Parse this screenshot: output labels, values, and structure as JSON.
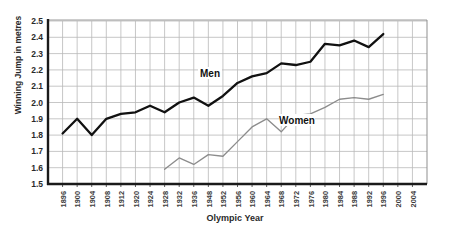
{
  "chart_data": {
    "type": "line",
    "title": "",
    "xlabel": "Olympic Year",
    "ylabel": "Winning Jump in metres",
    "ylim": [
      1.5,
      2.5
    ],
    "ytick_step": 0.1,
    "grid": true,
    "legend_position": "inline-annotation",
    "categories": [
      "1896",
      "1900",
      "1904",
      "1908",
      "1912",
      "1920",
      "1924",
      "1928",
      "1932",
      "1936",
      "1948",
      "1952",
      "1956",
      "1960",
      "1964",
      "1968",
      "1972",
      "1976",
      "1980",
      "1984",
      "1988",
      "1992",
      "1996",
      "2000",
      "2004"
    ],
    "ytick_labels": [
      "1.5",
      "1.6",
      "1.7",
      "1.8",
      "1.9",
      "2.0",
      "2.1",
      "2.2",
      "2.3",
      "2.4",
      "2.5"
    ],
    "series": [
      {
        "name": "Men",
        "color": "#111111",
        "label_annotation": "Men",
        "x": [
          "1896",
          "1900",
          "1904",
          "1908",
          "1912",
          "1920",
          "1924",
          "1928",
          "1932",
          "1936",
          "1948",
          "1952",
          "1956",
          "1960",
          "1964",
          "1968",
          "1972",
          "1976",
          "1980",
          "1984",
          "1988",
          "1992",
          "1996"
        ],
        "values": [
          1.81,
          1.9,
          1.8,
          1.9,
          1.93,
          1.94,
          1.98,
          1.94,
          2.0,
          2.03,
          1.98,
          2.04,
          2.12,
          2.16,
          2.18,
          2.24,
          2.23,
          2.25,
          2.36,
          2.35,
          2.38,
          2.34,
          2.42
        ]
      },
      {
        "name": "Women",
        "color": "#8c8c8c",
        "label_annotation": "Women",
        "x": [
          "1928",
          "1932",
          "1936",
          "1948",
          "1952",
          "1956",
          "1960",
          "1964",
          "1968",
          "1972",
          "1976",
          "1980",
          "1984",
          "1988",
          "1992",
          "1996"
        ],
        "values": [
          1.59,
          1.66,
          1.62,
          1.68,
          1.67,
          1.76,
          1.85,
          1.9,
          1.82,
          1.92,
          1.93,
          1.97,
          2.02,
          2.03,
          2.02,
          2.05
        ]
      }
    ],
    "annotations": [
      {
        "text": "Men",
        "x_px": 210,
        "y_px": 75
      },
      {
        "text": "Women",
        "x_px": 297,
        "y_px": 122
      }
    ]
  }
}
